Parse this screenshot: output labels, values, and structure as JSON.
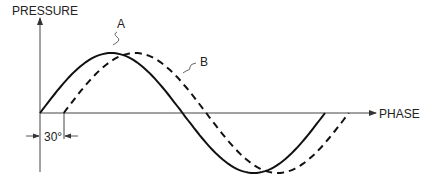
{
  "diagram": {
    "type": "phase-shift waveform",
    "y_axis_label": "PRESSURE",
    "x_axis_label": "PHASE",
    "curves": [
      {
        "name": "A",
        "style": "solid",
        "phase_offset_deg": 0
      },
      {
        "name": "B",
        "style": "dashed",
        "phase_offset_deg": 30
      }
    ],
    "dimension_label": "30°",
    "colors": {
      "line": "#111111",
      "text": "#222222",
      "background": "#ffffff"
    }
  }
}
